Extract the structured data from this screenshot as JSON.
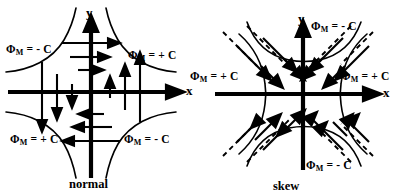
{
  "figure": {
    "width": 402,
    "height": 196,
    "background": "#ffffff",
    "ink": "#000000"
  },
  "panels": [
    {
      "id": "normal",
      "caption": "normal",
      "axes": {
        "x_label": "x",
        "y_label": "y"
      },
      "quadrant_labels": [
        {
          "quadrant": "upper-left",
          "phi": "Φ",
          "sub": "M",
          "eq": "= - C",
          "text": "ΦM = - C"
        },
        {
          "quadrant": "upper-right",
          "phi": "Φ",
          "sub": "M",
          "eq": "= + C",
          "text": "ΦM = + C"
        },
        {
          "quadrant": "lower-left",
          "phi": "Φ",
          "sub": "M",
          "eq": "= + C",
          "text": "ΦM = + C"
        },
        {
          "quadrant": "lower-right",
          "phi": "Φ",
          "sub": "M",
          "eq": "= - C",
          "text": "ΦM = - C"
        }
      ]
    },
    {
      "id": "skew",
      "caption": "skew",
      "axes": {
        "x_label": "x",
        "y_label": "y"
      },
      "quadrant_labels": [
        {
          "quadrant": "top",
          "phi": "Φ",
          "sub": "M",
          "eq": "= - C",
          "text": "ΦM = - C"
        },
        {
          "quadrant": "left",
          "phi": "Φ",
          "sub": "M",
          "eq": "= + C",
          "text": "ΦM = + C"
        },
        {
          "quadrant": "right",
          "phi": "Φ",
          "sub": "M",
          "eq": "= + C",
          "text": "ΦM = + C"
        },
        {
          "quadrant": "bottom",
          "phi": "Φ",
          "sub": "M",
          "eq": "= - C",
          "text": "ΦM = - C"
        }
      ]
    }
  ]
}
